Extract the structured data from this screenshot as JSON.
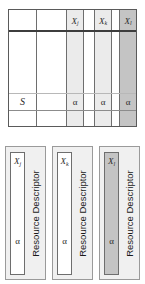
{
  "diagram": {
    "matrix": {
      "row_label": "S",
      "columns": [
        {
          "header": "",
          "base": "",
          "sub": "",
          "shade": "none"
        },
        {
          "header": "",
          "base": "",
          "sub": "",
          "shade": "none"
        },
        {
          "header": "Xj",
          "base": "X",
          "sub": "j",
          "shade": "light",
          "cell_value": "α"
        },
        {
          "header": "",
          "base": "",
          "sub": "",
          "shade": "none"
        },
        {
          "header": "Xk",
          "base": "X",
          "sub": "k",
          "shade": "light",
          "cell_value": "α"
        },
        {
          "header": "",
          "base": "",
          "sub": "",
          "shade": "none"
        },
        {
          "header": "Xl",
          "base": "X",
          "sub": "l",
          "shade": "dark",
          "cell_value": "α"
        }
      ],
      "alpha_symbol": "α"
    },
    "descriptors": [
      {
        "name": "resource-descriptor-j",
        "column_base": "X",
        "column_sub": "j",
        "alpha": "α",
        "label": "Resource Descriptor",
        "shade": "none"
      },
      {
        "name": "resource-descriptor-k",
        "column_base": "X",
        "column_sub": "k",
        "alpha": "α",
        "label": "Resource Descriptor",
        "shade": "none"
      },
      {
        "name": "resource-descriptor-l",
        "column_base": "X",
        "column_sub": "l",
        "alpha": "α",
        "label": "Resource Descriptor",
        "shade": "dark"
      }
    ],
    "colors": {
      "light_shade": "#ebebeb",
      "dark_shade": "#c4c4c4",
      "border": "#6e6e6e",
      "box_fill": "#f0f0f0",
      "text": "#2b2b2b"
    }
  }
}
